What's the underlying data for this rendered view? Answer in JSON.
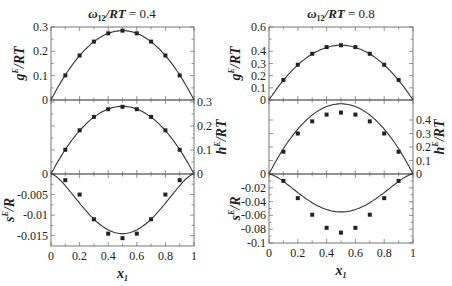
{
  "chart_data": [
    {
      "panel": "left",
      "title": "ω12/RT = 0.4",
      "title_parts": {
        "omega": "ω",
        "sub": "12",
        "rest": "/RT = 0.4"
      },
      "type": "scatter",
      "xlabel": "x1",
      "xlim": [
        0,
        1
      ],
      "x_ticks": [
        "0",
        "0.2",
        "0.4",
        "0.6",
        "0.8",
        "1"
      ],
      "x": [
        0.1,
        0.2,
        0.3,
        0.4,
        0.5,
        0.6,
        0.7,
        0.8,
        0.9
      ],
      "subplots": [
        {
          "name": "gE/RT",
          "ylabel": "gE/RT",
          "ylabel_side": "left",
          "ylim": [
            0,
            0.3
          ],
          "y_ticks": [
            "0",
            "0.1",
            "0.2",
            "0.3"
          ],
          "points": [
            0.101,
            0.183,
            0.24,
            0.274,
            0.285,
            0.274,
            0.24,
            0.183,
            0.101
          ],
          "curve_peak": 0.285
        },
        {
          "name": "hE/RT",
          "ylabel": "hE/RT",
          "ylabel_side": "right",
          "ylim": [
            0,
            0.3
          ],
          "y_ticks": [
            "0",
            "0.1",
            "0.2",
            "0.3"
          ],
          "points": [
            0.101,
            0.182,
            0.238,
            0.27,
            0.28,
            0.27,
            0.238,
            0.182,
            0.101
          ],
          "curve_peak": 0.282
        },
        {
          "name": "sE/R",
          "ylabel": "sE/R",
          "ylabel_side": "left",
          "ylim": [
            -0.0175,
            0
          ],
          "y_ticks": [
            "0",
            "-0.005",
            "-0.01",
            "-0.015"
          ],
          "points": [
            -0.0015,
            -0.005,
            -0.011,
            -0.0145,
            -0.0156,
            -0.0145,
            -0.011,
            -0.005,
            -0.0015
          ],
          "curve_min": -0.0145
        }
      ]
    },
    {
      "panel": "right",
      "title": "ω12/RT = 0.8",
      "title_parts": {
        "omega": "ω",
        "sub": "12",
        "rest": "/RT = 0.8"
      },
      "type": "scatter",
      "xlabel": "x1",
      "xlim": [
        0,
        1
      ],
      "x_ticks": [
        "0",
        "0.2",
        "0.4",
        "0.6",
        "0.8",
        "1"
      ],
      "x": [
        0.1,
        0.2,
        0.3,
        0.4,
        0.5,
        0.6,
        0.7,
        0.8,
        0.9
      ],
      "subplots": [
        {
          "name": "gE/RT",
          "ylabel": "gE/RT",
          "ylabel_side": "left",
          "ylim": [
            0,
            0.6
          ],
          "y_ticks": [
            "0",
            "0.1",
            "0.2",
            "0.3",
            "0.4",
            "0.5",
            "0.6"
          ],
          "y_tick_labels_shown": [
            "0",
            "0.1",
            "0.2",
            "0.3",
            "0.4",
            "0.6"
          ],
          "points": [
            0.165,
            0.29,
            0.38,
            0.435,
            0.45,
            0.435,
            0.38,
            0.29,
            0.165
          ],
          "curve_peak": 0.45
        },
        {
          "name": "hE/RT",
          "ylabel": "hE/RT",
          "ylabel_side": "right",
          "ylim": [
            0,
            0.54
          ],
          "y_ticks": [
            "0",
            "0.1",
            "0.2",
            "0.3",
            "0.4"
          ],
          "points": [
            0.165,
            0.3,
            0.39,
            0.44,
            0.455,
            0.44,
            0.39,
            0.3,
            0.165
          ],
          "curve_peak": 0.52
        },
        {
          "name": "sE/R",
          "ylabel": "sE/R",
          "ylabel_side": "left",
          "ylim": [
            -0.1,
            0
          ],
          "y_ticks": [
            "0",
            "-0.02",
            "-0.04",
            "-0.06",
            "-0.08",
            "-0.1"
          ],
          "points": [
            -0.01,
            -0.035,
            -0.059,
            -0.078,
            -0.085,
            -0.078,
            -0.059,
            -0.035,
            -0.01
          ],
          "curve_min": -0.055
        }
      ]
    }
  ]
}
